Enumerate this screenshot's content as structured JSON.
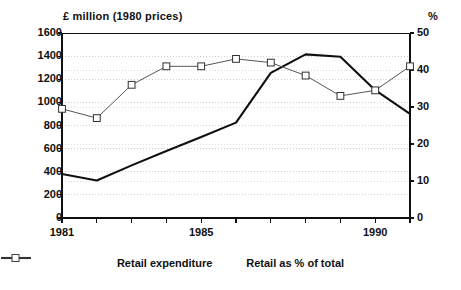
{
  "chart_data": {
    "type": "line",
    "title": "",
    "xlabel": "",
    "ylabel": "£ million (1980 prices)",
    "y2label": "%",
    "x": [
      1981,
      1982,
      1983,
      1984,
      1985,
      1986,
      1987,
      1988,
      1989,
      1990,
      1991
    ],
    "xtick_labels": [
      "1981",
      "1985",
      "1990"
    ],
    "xticks_shown": [
      1981,
      1985,
      1990
    ],
    "xlim": [
      1981,
      1991
    ],
    "ylim": [
      0,
      1600
    ],
    "y2lim": [
      0,
      50
    ],
    "ytick_labels": [
      "0",
      "200",
      "400",
      "600",
      "800",
      "1000",
      "1200",
      "1400",
      "1600"
    ],
    "ytick_values": [
      0,
      200,
      400,
      600,
      800,
      1000,
      1200,
      1400,
      1600
    ],
    "y2tick_labels": [
      "0",
      "10",
      "20",
      "30",
      "40",
      "50"
    ],
    "y2tick_values": [
      0,
      10,
      20,
      30,
      40,
      50
    ],
    "grid": true,
    "legend_position": "bottom",
    "series": [
      {
        "name": "Retail expenditure",
        "axis": "left",
        "units": "£ million (1980 prices)",
        "color": "#101010",
        "marker": "none",
        "line_width": 2.1,
        "values": [
          380,
          325,
          455,
          580,
          700,
          825,
          1255,
          1415,
          1395,
          1105,
          900
        ]
      },
      {
        "name": "Retail as % of total",
        "axis": "right",
        "units": "%",
        "color": "#555555",
        "marker": "square-open",
        "line_width": 1,
        "values": [
          29.5,
          27.0,
          36.0,
          41.0,
          41.0,
          43.0,
          42.0,
          38.5,
          33.0,
          34.5,
          41.0
        ]
      }
    ]
  },
  "axis_titles": {
    "left": "£ million (1980 prices)",
    "right": "%"
  },
  "legend": {
    "items": [
      {
        "label": "Retail expenditure",
        "marker": "line-with-dot"
      },
      {
        "label": "Retail as % of total",
        "marker": "line-with-square"
      }
    ]
  }
}
